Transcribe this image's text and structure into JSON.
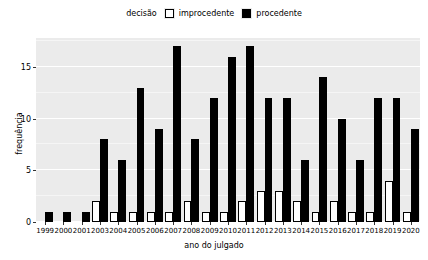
{
  "legend": {
    "title": "decisão",
    "entries": [
      {
        "label": "improcedente",
        "color": "#ffffff",
        "key_name": "legend-key-improcedente"
      },
      {
        "label": "procedente",
        "color": "#000000",
        "key_name": "legend-key-procedente"
      }
    ]
  },
  "axes": {
    "xlabel": "ano do julgado",
    "ylabel": "frequência",
    "yticks": [
      "0",
      "5",
      "10",
      "15"
    ],
    "ylim": [
      0,
      17.8
    ],
    "grid": true
  },
  "chart_data": {
    "type": "bar",
    "title": "",
    "subtitle": "",
    "xlabel": "ano do julgado",
    "ylabel": "frequência",
    "ylim": [
      0,
      17.8
    ],
    "yticks": [
      0,
      5,
      10,
      15
    ],
    "grid": true,
    "legend_title": "decisão",
    "legend_position": "top",
    "grouping": "dodged",
    "categories": [
      "1999",
      "2000",
      "2001",
      "2003",
      "2004",
      "2005",
      "2006",
      "2007",
      "2008",
      "2009",
      "2010",
      "2011",
      "2012",
      "2013",
      "2014",
      "2015",
      "2016",
      "2017",
      "2018",
      "2019",
      "2020"
    ],
    "series": [
      {
        "name": "improcedente",
        "color": "#ffffff",
        "values": [
          0,
          0,
          0,
          2,
          1,
          1,
          1,
          1,
          2,
          1,
          1,
          2,
          3,
          3,
          2,
          1,
          2,
          1,
          1,
          4,
          1
        ]
      },
      {
        "name": "procedente",
        "color": "#000000",
        "values": [
          1,
          1,
          1,
          8,
          6,
          13,
          9,
          17,
          8,
          12,
          16,
          17,
          12,
          12,
          6,
          14,
          10,
          6,
          12,
          12,
          9
        ]
      }
    ]
  },
  "style": {
    "panel_background": "#ebebeb",
    "gridline_color": "#ffffff",
    "text_color": "#000000"
  }
}
